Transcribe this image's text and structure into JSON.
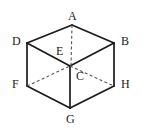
{
  "figure": {
    "name": "cube-diagram",
    "type": "geometric-solid",
    "solid": "cube",
    "background_color": "#ffffff",
    "stroke_color": "#1a1a1a",
    "hidden_edge_color": "#555555",
    "label_color": "#1a1a1a",
    "canvas": {
      "width": 143,
      "height": 133
    }
  },
  "vertices": [
    {
      "id": "A",
      "label": "A",
      "x": 72,
      "y": 25,
      "label_x": 68,
      "label_y": 10,
      "visible": true
    },
    {
      "id": "B",
      "label": "B",
      "x": 114,
      "y": 43,
      "label_x": 121,
      "label_y": 35,
      "visible": true
    },
    {
      "id": "C",
      "label": "C",
      "x": 70,
      "y": 66,
      "label_x": 76,
      "label_y": 70,
      "visible": true
    },
    {
      "id": "D",
      "label": "D",
      "x": 27,
      "y": 43,
      "label_x": 12,
      "label_y": 35,
      "visible": true
    },
    {
      "id": "E",
      "label": "E",
      "x": 70,
      "y": 66,
      "label_x": 56,
      "label_y": 45,
      "visible": false
    },
    {
      "id": "F",
      "label": "F",
      "x": 27,
      "y": 86,
      "label_x": 12,
      "label_y": 78,
      "visible": true
    },
    {
      "id": "G",
      "label": "G",
      "x": 70,
      "y": 108,
      "label_x": 66,
      "label_y": 113,
      "visible": true
    },
    {
      "id": "H",
      "label": "H",
      "x": 114,
      "y": 86,
      "label_x": 121,
      "label_y": 78,
      "visible": true
    }
  ],
  "edges": {
    "solid": [
      {
        "from": "D",
        "to": "A",
        "points": "27,43 72,25"
      },
      {
        "from": "A",
        "to": "B",
        "points": "72,25 114,43"
      },
      {
        "from": "D",
        "to": "C",
        "points": "27,43 70,66"
      },
      {
        "from": "C",
        "to": "B",
        "points": "70,66 114,43"
      },
      {
        "from": "D",
        "to": "F",
        "points": "27,43 27,86"
      },
      {
        "from": "B",
        "to": "H",
        "points": "114,43 114,86"
      },
      {
        "from": "C",
        "to": "G",
        "points": "70,66 70,108"
      },
      {
        "from": "F",
        "to": "G",
        "points": "27,86 70,108"
      },
      {
        "from": "G",
        "to": "H",
        "points": "70,108 114,86"
      }
    ],
    "dashed": [
      {
        "from": "A",
        "to": "E",
        "points": "72,25 71,66"
      },
      {
        "from": "F",
        "to": "E",
        "points": "27,86 70,66"
      },
      {
        "from": "E",
        "to": "H",
        "points": "70,66 114,86"
      }
    ]
  }
}
